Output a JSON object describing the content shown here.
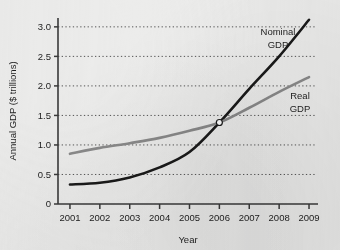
{
  "chart_data": {
    "type": "line",
    "title": "",
    "xlabel": "Year",
    "ylabel": "Annual GDP ($ trillions)",
    "x": [
      2001,
      2002,
      2003,
      2004,
      2005,
      2006,
      2007,
      2008,
      2009
    ],
    "xtick_labels": [
      "2001",
      "2002",
      "2003",
      "2004",
      "2005",
      "2006",
      "2007",
      "2008",
      "2009"
    ],
    "ytick_labels": [
      "0",
      "0.5",
      "1.0",
      "1.5",
      "2.0",
      "2.5",
      "3.0"
    ],
    "ytick_values": [
      0,
      0.5,
      1.0,
      1.5,
      2.0,
      2.5,
      3.0
    ],
    "xlim": [
      2000.6,
      2009.2
    ],
    "ylim": [
      0,
      3.15
    ],
    "grid": "horizontal-dotted",
    "legend": "inline-annotations",
    "series": [
      {
        "name": "Nominal GDP",
        "label_line1": "Nominal",
        "label_line2": "GDP",
        "color": "#1a1a1a",
        "width": 2.6,
        "values": [
          0.33,
          0.36,
          0.45,
          0.62,
          0.88,
          1.38,
          1.95,
          2.5,
          3.12
        ]
      },
      {
        "name": "Real GDP",
        "label_line1": "Real",
        "label_line2": "GDP",
        "color": "#8a8a8a",
        "width": 2.6,
        "values": [
          0.85,
          0.95,
          1.03,
          1.12,
          1.24,
          1.38,
          1.63,
          1.9,
          2.15
        ]
      }
    ],
    "annotations": [
      {
        "name": "intersection-marker",
        "x": 2006,
        "y": 1.38,
        "marker": "open-circle",
        "fill": "#ffffff",
        "stroke": "#1a1a1a"
      }
    ]
  },
  "axes": {
    "axis_color": "#3a3a3a",
    "grid_color": "#555555",
    "background": "#ececeb"
  }
}
